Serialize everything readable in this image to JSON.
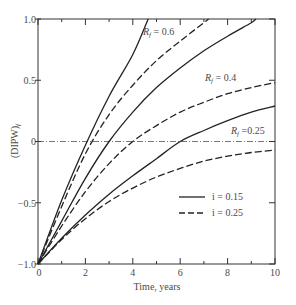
{
  "chart_data": {
    "type": "line",
    "title": "",
    "xlabel": "Time, years",
    "ylabel": "(DIPW)f",
    "xlim": [
      0,
      10
    ],
    "ylim": [
      -1.0,
      1.0
    ],
    "x_ticks": [
      0,
      2,
      4,
      6,
      8,
      10
    ],
    "x_minor_ticks": [
      1,
      3,
      5,
      7,
      9
    ],
    "y_ticks": [
      -1.0,
      -0.5,
      0,
      0.5,
      1.0
    ],
    "y_tick_labels": [
      "−1.0",
      "−0.5",
      "0",
      "0.5",
      "1.0"
    ],
    "grid": false,
    "reference_line": {
      "y": 0,
      "style": "dash-dot"
    },
    "legend": {
      "position": "lower right",
      "entries": [
        {
          "label": "i = 0.15",
          "style": "solid"
        },
        {
          "label": "i = 0.25",
          "style": "dashed"
        }
      ]
    },
    "curve_labels": [
      {
        "text": "Rf = 0.6",
        "x": 5.3,
        "y": 0.86
      },
      {
        "text": "Rf = 0.4",
        "x": 6.5,
        "y": 0.5
      },
      {
        "text": "Rf = 0.25",
        "x": 7.3,
        "y": 0.08
      }
    ],
    "series": [
      {
        "name": "Rf = 0.6, i = 0.15",
        "Rf": 0.6,
        "i": 0.15,
        "style": "solid",
        "x": [
          0,
          1,
          2,
          3,
          4,
          4.65
        ],
        "y": [
          -1.0,
          -0.48,
          -0.03,
          0.37,
          0.71,
          1.0
        ]
      },
      {
        "name": "Rf = 0.6, i = 0.25",
        "Rf": 0.6,
        "i": 0.25,
        "style": "dashed",
        "x": [
          0,
          1,
          2,
          3,
          4,
          5,
          6,
          7,
          7.2
        ],
        "y": [
          -1.0,
          -0.53,
          -0.1,
          0.22,
          0.46,
          0.66,
          0.82,
          0.97,
          1.0
        ]
      },
      {
        "name": "Rf = 0.4, i = 0.15",
        "Rf": 0.4,
        "i": 0.15,
        "style": "solid",
        "x": [
          0,
          1,
          2,
          3,
          4,
          5,
          6,
          7,
          8,
          9,
          9.2
        ],
        "y": [
          -1.0,
          -0.65,
          -0.3,
          0.0,
          0.24,
          0.44,
          0.6,
          0.74,
          0.86,
          0.97,
          1.0
        ]
      },
      {
        "name": "Rf = 0.4, i = 0.25",
        "Rf": 0.4,
        "i": 0.25,
        "style": "dashed",
        "x": [
          0,
          1,
          2,
          3,
          4,
          5,
          6,
          7,
          8,
          9,
          10
        ],
        "y": [
          -1.0,
          -0.69,
          -0.41,
          -0.18,
          0.0,
          0.13,
          0.24,
          0.32,
          0.39,
          0.44,
          0.48
        ]
      },
      {
        "name": "Rf = 0.25, i = 0.15",
        "Rf": 0.25,
        "i": 0.15,
        "style": "solid",
        "x": [
          0,
          1,
          2,
          3,
          4,
          5,
          6,
          7,
          8,
          9,
          10
        ],
        "y": [
          -1.0,
          -0.79,
          -0.6,
          -0.43,
          -0.28,
          -0.14,
          0.0,
          0.09,
          0.17,
          0.24,
          0.29
        ]
      },
      {
        "name": "Rf = 0.25, i = 0.25",
        "Rf": 0.25,
        "i": 0.25,
        "style": "dashed",
        "x": [
          0,
          1,
          2,
          3,
          4,
          5,
          6,
          7,
          8,
          9,
          10
        ],
        "y": [
          -1.0,
          -0.8,
          -0.63,
          -0.49,
          -0.38,
          -0.29,
          -0.22,
          -0.16,
          -0.12,
          -0.09,
          -0.07
        ]
      }
    ]
  },
  "labels": {
    "xlabel": "Time, years",
    "ylabel_main": "(DIPW)",
    "ylabel_sub": "f",
    "legend_solid": "i = 0.15",
    "legend_dashed": "i = 0.25",
    "curve_06_R": "R",
    "curve_06_sub": "f",
    "curve_06_val": " = 0.6",
    "curve_04_R": "R",
    "curve_04_sub": "f",
    "curve_04_val": " = 0.4",
    "curve_025_R": "R",
    "curve_025_sub": "f",
    "curve_025_val": " =0.25",
    "x_tick_0": "0",
    "x_tick_2": "2",
    "x_tick_4": "4",
    "x_tick_6": "6",
    "x_tick_8": "8",
    "x_tick_10": "10",
    "y_tick_n1": "−1.0",
    "y_tick_n05": "−0.5",
    "y_tick_0": "0",
    "y_tick_05": "0.5",
    "y_tick_1": "1.0"
  }
}
